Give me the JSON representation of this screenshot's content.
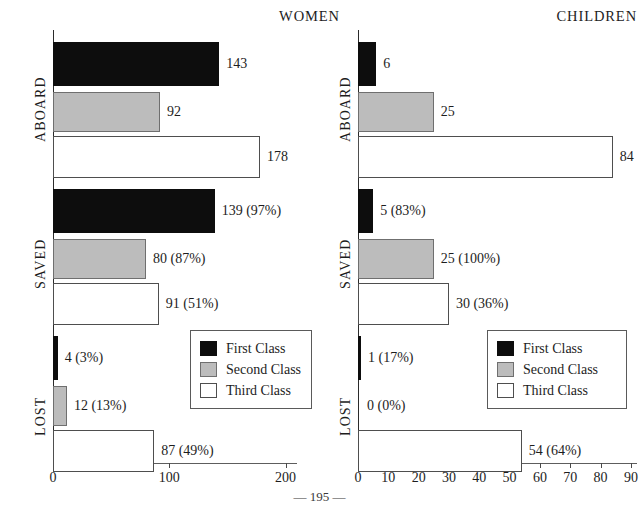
{
  "page": {
    "footer": "— 195 —"
  },
  "legend": {
    "items": [
      {
        "key": "first",
        "label": "First Class",
        "color": "#0d0d0d"
      },
      {
        "key": "second",
        "label": "Second Class",
        "color": "#bcbcbc"
      },
      {
        "key": "third",
        "label": "Third Class",
        "color": "#ffffff"
      }
    ]
  },
  "chart_data": {
    "type": "bar",
    "orientation": "horizontal",
    "grid": false,
    "legend_position": "inside-lower-right",
    "panels": [
      {
        "name": "women",
        "title": "WOMEN",
        "xlabel": "",
        "ylabel": "",
        "xlim": [
          0,
          210
        ],
        "xticks": [
          0,
          100,
          200
        ],
        "xticklabels": [
          "0",
          "100",
          "200"
        ],
        "groups": [
          {
            "label": "ABOARD",
            "bars": [
              {
                "series": "First Class",
                "value": 143,
                "label": "143"
              },
              {
                "series": "Second Class",
                "value": 92,
                "label": "92"
              },
              {
                "series": "Third Class",
                "value": 178,
                "label": "178"
              }
            ]
          },
          {
            "label": "SAVED",
            "bars": [
              {
                "series": "First Class",
                "value": 139,
                "percent": 97,
                "label": "139 (97%)"
              },
              {
                "series": "Second Class",
                "value": 80,
                "percent": 87,
                "label": "80 (87%)"
              },
              {
                "series": "Third Class",
                "value": 91,
                "percent": 51,
                "label": "91 (51%)"
              }
            ]
          },
          {
            "label": "LOST",
            "bars": [
              {
                "series": "First Class",
                "value": 4,
                "percent": 3,
                "label": "4 (3%)"
              },
              {
                "series": "Second Class",
                "value": 12,
                "percent": 13,
                "label": "12 (13%)"
              },
              {
                "series": "Third Class",
                "value": 87,
                "percent": 49,
                "label": "87 (49%)"
              }
            ]
          }
        ]
      },
      {
        "name": "children",
        "title": "CHILDREN",
        "xlabel": "",
        "ylabel": "",
        "xlim": [
          0,
          92
        ],
        "xticks": [
          0,
          10,
          20,
          30,
          40,
          50,
          60,
          70,
          80,
          90
        ],
        "xticklabels": [
          "0",
          "10",
          "20",
          "30",
          "40",
          "50",
          "60",
          "70",
          "80",
          "90"
        ],
        "groups": [
          {
            "label": "ABOARD",
            "bars": [
              {
                "series": "First Class",
                "value": 6,
                "label": "6"
              },
              {
                "series": "Second Class",
                "value": 25,
                "label": "25"
              },
              {
                "series": "Third Class",
                "value": 84,
                "label": "84"
              }
            ]
          },
          {
            "label": "SAVED",
            "bars": [
              {
                "series": "First Class",
                "value": 5,
                "percent": 83,
                "label": "5 (83%)"
              },
              {
                "series": "Second Class",
                "value": 25,
                "percent": 100,
                "label": "25 (100%)"
              },
              {
                "series": "Third Class",
                "value": 30,
                "percent": 36,
                "label": "30 (36%)"
              }
            ]
          },
          {
            "label": "LOST",
            "bars": [
              {
                "series": "First Class",
                "value": 1,
                "percent": 17,
                "label": "1 (17%)"
              },
              {
                "series": "Second Class",
                "value": 0,
                "percent": 0,
                "label": "0 (0%)"
              },
              {
                "series": "Third Class",
                "value": 54,
                "percent": 64,
                "label": "54 (64%)"
              }
            ]
          }
        ]
      }
    ]
  }
}
